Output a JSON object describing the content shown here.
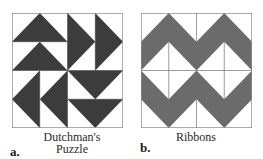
{
  "figure": {
    "panels": [
      {
        "id": "a",
        "letter": "a.",
        "caption_line1": "Dutchman's",
        "caption_line2": "Puzzle",
        "fill_color": "#3c3c3c"
      },
      {
        "id": "b",
        "letter": "b.",
        "caption_line1": "Ribbons",
        "fill_color": "#6b6b6b"
      }
    ],
    "line_color": "#8a8a8a",
    "background": "#ffffff"
  }
}
